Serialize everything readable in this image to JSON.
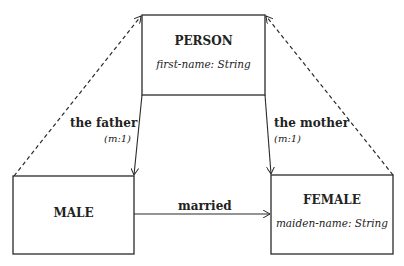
{
  "diagram": {
    "type": "class-diagram",
    "classes": [
      {
        "id": "person",
        "name": "PERSON",
        "attribute": "first-name: String"
      },
      {
        "id": "male",
        "name": "MALE",
        "attribute": ""
      },
      {
        "id": "female",
        "name": "FEMALE",
        "attribute": "maiden-name: String"
      }
    ],
    "relations": [
      {
        "id": "father",
        "label": "the father",
        "cardinality": "(m:1)",
        "from": "male",
        "to": "person"
      },
      {
        "id": "mother",
        "label": "the mother",
        "cardinality": "(m:1)",
        "from": "female",
        "to": "person"
      },
      {
        "id": "married",
        "label": "married",
        "cardinality": "",
        "from": "male",
        "to": "female"
      }
    ],
    "generalizations": [
      {
        "from": "male",
        "to": "person",
        "style": "dashed"
      },
      {
        "from": "female",
        "to": "person",
        "style": "dashed"
      }
    ],
    "colors": {
      "line": "#2a2a2a",
      "background": "#ffffff"
    }
  }
}
